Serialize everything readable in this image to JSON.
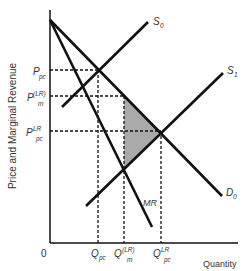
{
  "axes": {
    "y_label": "Price and Marginal Revenue",
    "x_label": "Quantity",
    "origin": "0"
  },
  "price_labels": [
    {
      "main": "P",
      "sub": "pc",
      "sup": ""
    },
    {
      "main": "P",
      "sub": "m",
      "sup": "(LR)"
    },
    {
      "main": "P",
      "sub": "pc",
      "sup": "LR"
    }
  ],
  "quantity_labels": [
    {
      "main": "Q",
      "sub": "pc",
      "sup": ""
    },
    {
      "main": "Q",
      "sub": "m",
      "sup": "(LR)"
    },
    {
      "main": "Q",
      "sub": "pc",
      "sup": "LR"
    }
  ],
  "curves": {
    "s0": {
      "main": "S",
      "sub": "0"
    },
    "s1": {
      "main": "S",
      "sub": "1"
    },
    "d0": {
      "main": "D",
      "sub": "0"
    },
    "mr": {
      "main": "MR"
    }
  },
  "colors": {
    "line": "#111111",
    "shaded": "#aaaaaa",
    "text": "#333333"
  }
}
